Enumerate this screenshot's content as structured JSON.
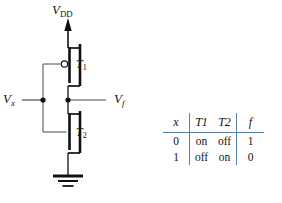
{
  "figure": {
    "background_color": "#ffffff",
    "wire_color": "#111111",
    "rule_color": "#5b7fa6"
  },
  "circuit": {
    "supply_label": "V",
    "supply_sub": "DD",
    "input_label": "V",
    "input_sub": "x",
    "output_label": "V",
    "output_sub": "f",
    "transistor_top_label": "T",
    "transistor_top_sub": "1",
    "transistor_bottom_label": "T",
    "transistor_bottom_sub": "2",
    "nodes": {
      "supply_arrow": "up-arrow-icon",
      "ground": "ground-icon",
      "input_junction": "junction-dot",
      "output_junction": "junction-dot",
      "pmos_bubble": "inversion-bubble-icon"
    }
  },
  "truth_table": {
    "headers": [
      "x",
      "T1",
      "T2",
      "f"
    ],
    "header_display": [
      {
        "base": "x",
        "sub": ""
      },
      {
        "base": "T",
        "sub": "1"
      },
      {
        "base": "T",
        "sub": "2"
      },
      {
        "base": "f",
        "sub": ""
      }
    ],
    "rows": [
      {
        "x": "0",
        "t1": "on",
        "t2": "off",
        "f": "1"
      },
      {
        "x": "1",
        "t1": "off",
        "t2": "on",
        "f": "0"
      }
    ]
  }
}
